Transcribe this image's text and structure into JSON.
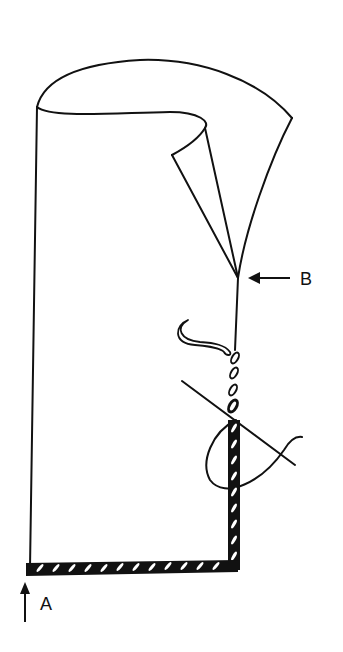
{
  "figure": {
    "type": "sewing-stitch-illustration",
    "labels": [
      {
        "id": "A",
        "text": "A",
        "pointer": "up-arrow",
        "target": "start of stitching at bottom-left corner"
      },
      {
        "id": "B",
        "text": "B",
        "pointer": "left-arrow",
        "target": "point where fold tapers into seam"
      }
    ],
    "colors": {
      "ink": "#111111",
      "background": "#ffffff"
    }
  }
}
